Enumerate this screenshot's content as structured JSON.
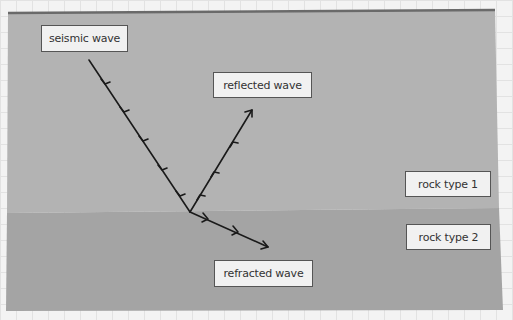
{
  "diagram": {
    "colors": {
      "background": "#f3f3f3",
      "grid": "#e2e2e2",
      "rock_type_1": "#b3b3b3",
      "rock_type_2": "#a4a4a4",
      "top_border": "#6a6a6a",
      "ray": "#1a1a1a",
      "label_bg": "#f1f1f1",
      "label_border": "#555555"
    },
    "labels": {
      "incident": "seismic wave",
      "reflected": "reflected wave",
      "refracted": "refracted wave",
      "layer_1": "rock type 1",
      "layer_2": "rock type 2"
    },
    "rays": [
      {
        "name": "incident",
        "from": [
          89,
          60
        ],
        "to": [
          190,
          212
        ]
      },
      {
        "name": "reflected",
        "from": [
          190,
          212
        ],
        "to": [
          252,
          110
        ]
      },
      {
        "name": "refracted",
        "from": [
          190,
          212
        ],
        "to": [
          268,
          247
        ]
      }
    ]
  }
}
